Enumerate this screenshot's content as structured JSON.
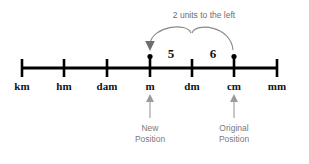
{
  "figure": {
    "title_annotation": "2 units to the left",
    "axis": {
      "units": [
        {
          "label": "km",
          "x": 22
        },
        {
          "label": "hm",
          "x": 64
        },
        {
          "label": "dam",
          "x": 107
        },
        {
          "label": "m",
          "x": 150
        },
        {
          "label": "dm",
          "x": 192
        },
        {
          "label": "cm",
          "x": 234
        },
        {
          "label": "mm",
          "x": 277
        }
      ],
      "line_y": 68,
      "start_x": 22,
      "end_x": 277
    },
    "values": [
      {
        "text": "5",
        "x": 171,
        "y": 56
      },
      {
        "text": "6",
        "x": 213,
        "y": 56
      }
    ],
    "markers": [
      {
        "name": "new-position-dot",
        "x": 150,
        "y": 57
      },
      {
        "name": "original-position-dot",
        "x": 234,
        "y": 57
      }
    ],
    "callouts": [
      {
        "label_line1": "New",
        "label_line2": "Position",
        "x": 150
      },
      {
        "label_line1": "Original",
        "label_line2": "Position",
        "x": 234
      }
    ],
    "colors": {
      "line": "#000000",
      "text": "#111111",
      "annotation": "#6e6e6e",
      "arc": "#8a8a8a",
      "pointer": "#9a9a9a",
      "background": "#ffffff"
    }
  }
}
